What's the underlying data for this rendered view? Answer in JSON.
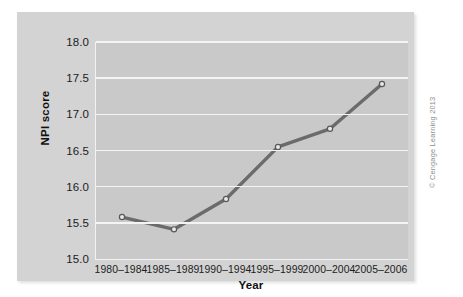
{
  "chart_data": {
    "type": "line",
    "title": "",
    "xlabel": "Year",
    "ylabel": "NPI score",
    "categories": [
      "1980–1984",
      "1985–1989",
      "1990–1994",
      "1995–1999",
      "2000–2004",
      "2005–2006"
    ],
    "values": [
      15.58,
      15.41,
      15.83,
      16.55,
      16.8,
      17.42
    ],
    "series": [
      {
        "name": "NPI score",
        "values": [
          15.58,
          15.41,
          15.83,
          16.55,
          16.8,
          17.42
        ]
      }
    ],
    "ylim": [
      15.0,
      18.0
    ],
    "yticks": [
      "15.0",
      "15.5",
      "16.0",
      "16.5",
      "17.0",
      "17.5",
      "18.0"
    ],
    "ytick_values": [
      15.0,
      15.5,
      16.0,
      16.5,
      17.0,
      17.5,
      18.0
    ],
    "grid": true,
    "grid_axis": "y",
    "legend": false,
    "legend_position": "none",
    "marker": "open-circle",
    "line_color": "#6b6b6b",
    "marker_face_color": "#e8e8e8",
    "marker_edge_color": "#595959",
    "grid_color": "#f4f4f4",
    "plot_background": "#c9c9c9",
    "figure_background": "#d3d3d3",
    "axis_color": "#f2f2f2",
    "text_color": "#1c1c1c"
  },
  "credit": {
    "text": "© Cengage Learning 2013"
  }
}
